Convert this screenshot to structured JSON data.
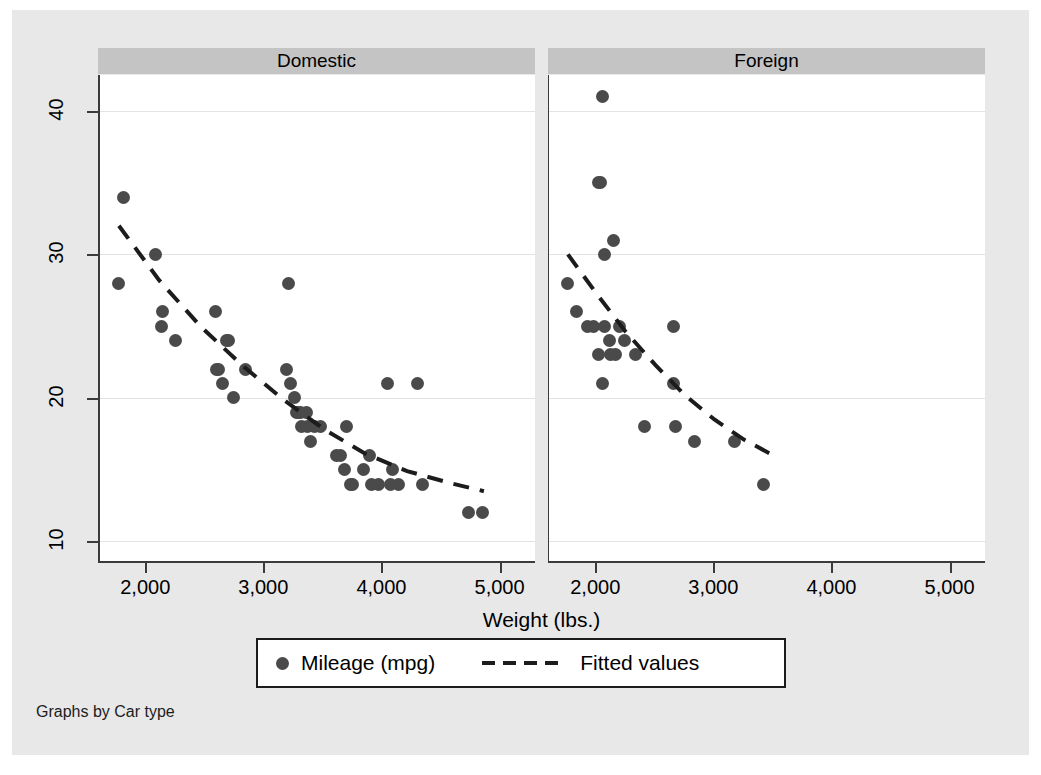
{
  "chart_data": {
    "type": "scatter",
    "title": "",
    "xlabel": "Weight (lbs.)",
    "ylabel": "",
    "xlim": [
      1600,
      5300
    ],
    "ylim": [
      8.5,
      42.5
    ],
    "xticks": [
      2000,
      3000,
      4000,
      5000
    ],
    "xticklabels": [
      "2,000",
      "3,000",
      "4,000",
      "5,000"
    ],
    "yticks": [
      10,
      20,
      30,
      40
    ],
    "yticklabels": [
      "10",
      "20",
      "30",
      "40"
    ],
    "grid": "horizontal",
    "legend_position": "bottom",
    "facet_by": "Car type",
    "footer": "Graphs by Car type",
    "marker_color": "#4a4a4a",
    "fit_color": "#1c1c1c",
    "header_color": "#c4c4c4",
    "background_color": "#e8e8e8",
    "panels": [
      {
        "label": "Domestic",
        "series": [
          {
            "name": "Mileage (mpg)",
            "type": "scatter",
            "points": [
              {
                "x": 1800,
                "y": 34
              },
              {
                "x": 1760,
                "y": 28
              },
              {
                "x": 2070,
                "y": 30
              },
              {
                "x": 2120,
                "y": 25
              },
              {
                "x": 2130,
                "y": 26
              },
              {
                "x": 2240,
                "y": 24
              },
              {
                "x": 2580,
                "y": 26
              },
              {
                "x": 2590,
                "y": 22
              },
              {
                "x": 2600,
                "y": 22
              },
              {
                "x": 2640,
                "y": 21
              },
              {
                "x": 2670,
                "y": 24
              },
              {
                "x": 2690,
                "y": 24
              },
              {
                "x": 2730,
                "y": 20
              },
              {
                "x": 2830,
                "y": 22
              },
              {
                "x": 3180,
                "y": 22
              },
              {
                "x": 3200,
                "y": 28
              },
              {
                "x": 3210,
                "y": 21
              },
              {
                "x": 3250,
                "y": 20
              },
              {
                "x": 3260,
                "y": 19
              },
              {
                "x": 3280,
                "y": 19
              },
              {
                "x": 3300,
                "y": 19
              },
              {
                "x": 3310,
                "y": 18
              },
              {
                "x": 3350,
                "y": 19
              },
              {
                "x": 3360,
                "y": 18
              },
              {
                "x": 3380,
                "y": 17
              },
              {
                "x": 3420,
                "y": 18
              },
              {
                "x": 3470,
                "y": 18
              },
              {
                "x": 3600,
                "y": 16
              },
              {
                "x": 3640,
                "y": 16
              },
              {
                "x": 3670,
                "y": 15
              },
              {
                "x": 3690,
                "y": 18
              },
              {
                "x": 3720,
                "y": 14
              },
              {
                "x": 3740,
                "y": 14
              },
              {
                "x": 3830,
                "y": 15
              },
              {
                "x": 3880,
                "y": 16
              },
              {
                "x": 3900,
                "y": 14
              },
              {
                "x": 3960,
                "y": 14
              },
              {
                "x": 4030,
                "y": 21
              },
              {
                "x": 4060,
                "y": 14
              },
              {
                "x": 4080,
                "y": 15
              },
              {
                "x": 4130,
                "y": 14
              },
              {
                "x": 4290,
                "y": 21
              },
              {
                "x": 4330,
                "y": 14
              },
              {
                "x": 4720,
                "y": 12
              },
              {
                "x": 4840,
                "y": 12
              }
            ]
          },
          {
            "name": "Fitted values",
            "type": "line",
            "style": "dashed",
            "points": [
              {
                "x": 1760,
                "y": 32.0
              },
              {
                "x": 2100,
                "y": 28.2
              },
              {
                "x": 2450,
                "y": 25.0
              },
              {
                "x": 2800,
                "y": 22.3
              },
              {
                "x": 3150,
                "y": 19.9
              },
              {
                "x": 3500,
                "y": 17.8
              },
              {
                "x": 3850,
                "y": 16.1
              },
              {
                "x": 4200,
                "y": 14.9
              },
              {
                "x": 4550,
                "y": 14.1
              },
              {
                "x": 4850,
                "y": 13.5
              }
            ]
          }
        ]
      },
      {
        "label": "Foreign",
        "series": [
          {
            "name": "Mileage (mpg)",
            "type": "scatter",
            "points": [
              {
                "x": 2050,
                "y": 41
              },
              {
                "x": 2020,
                "y": 35
              },
              {
                "x": 2040,
                "y": 35
              },
              {
                "x": 2150,
                "y": 31
              },
              {
                "x": 2070,
                "y": 30
              },
              {
                "x": 1760,
                "y": 28
              },
              {
                "x": 1830,
                "y": 26
              },
              {
                "x": 1930,
                "y": 25
              },
              {
                "x": 1980,
                "y": 25
              },
              {
                "x": 2070,
                "y": 25
              },
              {
                "x": 2200,
                "y": 25
              },
              {
                "x": 2650,
                "y": 25
              },
              {
                "x": 2110,
                "y": 24
              },
              {
                "x": 2240,
                "y": 24
              },
              {
                "x": 2330,
                "y": 23
              },
              {
                "x": 2020,
                "y": 23
              },
              {
                "x": 2120,
                "y": 23
              },
              {
                "x": 2160,
                "y": 23
              },
              {
                "x": 2050,
                "y": 21
              },
              {
                "x": 2650,
                "y": 21
              },
              {
                "x": 2410,
                "y": 18
              },
              {
                "x": 2670,
                "y": 18
              },
              {
                "x": 2830,
                "y": 17
              },
              {
                "x": 3170,
                "y": 17
              },
              {
                "x": 3420,
                "y": 14
              }
            ]
          },
          {
            "name": "Fitted values",
            "type": "line",
            "style": "dashed",
            "points": [
              {
                "x": 1760,
                "y": 30.0
              },
              {
                "x": 2000,
                "y": 27.3
              },
              {
                "x": 2250,
                "y": 24.6
              },
              {
                "x": 2500,
                "y": 22.3
              },
              {
                "x": 2750,
                "y": 20.2
              },
              {
                "x": 3000,
                "y": 18.5
              },
              {
                "x": 3250,
                "y": 17.1
              },
              {
                "x": 3500,
                "y": 16.0
              }
            ]
          }
        ]
      }
    ],
    "legend": [
      {
        "label": "Mileage (mpg)",
        "marker": "circle",
        "color": "#4a4a4a"
      },
      {
        "label": "Fitted values",
        "marker": "dashed-line",
        "color": "#1c1c1c"
      }
    ]
  }
}
